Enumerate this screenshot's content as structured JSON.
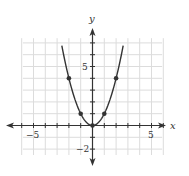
{
  "chart_data": {
    "type": "line",
    "title": "",
    "xlabel": "x",
    "ylabel": "y",
    "function": "y = x^2",
    "x_tick_labels": [
      "-5",
      "5"
    ],
    "y_tick_labels": [
      "5",
      "-2"
    ],
    "xlim": [
      -6,
      6
    ],
    "ylim": [
      -3,
      7
    ],
    "grid": true,
    "series": [
      {
        "name": "y = x^2",
        "x": [
          -2.6,
          -2,
          -1,
          0,
          1,
          2,
          2.6
        ],
        "y": [
          6.76,
          4,
          1,
          0,
          1,
          4,
          6.76
        ]
      }
    ],
    "marked_points": [
      {
        "x": -2,
        "y": 4
      },
      {
        "x": -1,
        "y": 1
      },
      {
        "x": 0,
        "y": 0
      },
      {
        "x": 1,
        "y": 1
      },
      {
        "x": 2,
        "y": 4
      }
    ]
  },
  "axes": {
    "x_label": "x",
    "y_label": "y",
    "x_neg_label": "−5",
    "x_pos_label": "5",
    "y_pos_label": "5",
    "y_neg_label": "−2"
  },
  "colors": {
    "grid": "#dcdcdc",
    "axis": "#333333",
    "curve": "#333333"
  }
}
